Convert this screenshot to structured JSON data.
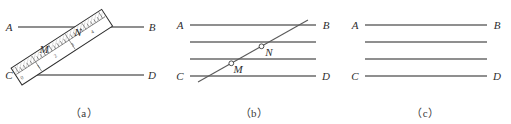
{
  "figure": {
    "panels": [
      {
        "id": "a",
        "caption": "（a）",
        "description": "ruler-on-parallel-lines",
        "line_labels": {
          "A": "A",
          "B": "B",
          "C": "C",
          "D": "D"
        },
        "point_labels": {
          "M": "M",
          "N": "N"
        },
        "ruler": {
          "tick_numbers": [
            "0",
            "1",
            "2",
            "3",
            "4"
          ],
          "angle_deg": -33
        },
        "lines": [
          {
            "name": "line-AB",
            "left_label": "A",
            "right_label": "B",
            "y": 27
          },
          {
            "name": "line-CD",
            "left_label": "C",
            "right_label": "D",
            "y": 75
          }
        ]
      },
      {
        "id": "b",
        "caption": "（b）",
        "description": "four-parallel-lines-with-transversal",
        "line_labels": {
          "A": "A",
          "B": "B",
          "C": "C",
          "D": "D"
        },
        "point_labels": {
          "M": "M",
          "N": "N"
        },
        "lines": [
          {
            "name": "line-AB",
            "left_label": "A",
            "right_label": "B",
            "y": 25
          },
          {
            "name": "line-2",
            "left_label": "",
            "right_label": "",
            "y": 42
          },
          {
            "name": "line-3",
            "left_label": "",
            "right_label": "",
            "y": 59
          },
          {
            "name": "line-CD",
            "left_label": "C",
            "right_label": "D",
            "y": 76
          }
        ],
        "transversal": {
          "name": "transversal-line",
          "x1": 30,
          "y1": 82,
          "x2": 140,
          "y2": 20
        }
      },
      {
        "id": "c",
        "caption": "（c）",
        "description": "four-parallel-lines",
        "line_labels": {
          "A": "A",
          "B": "B",
          "C": "C",
          "D": "D"
        },
        "lines": [
          {
            "name": "line-AB",
            "left_label": "A",
            "right_label": "B",
            "y": 25
          },
          {
            "name": "line-2",
            "left_label": "",
            "right_label": "",
            "y": 42
          },
          {
            "name": "line-3",
            "left_label": "",
            "right_label": "",
            "y": 59
          },
          {
            "name": "line-CD",
            "left_label": "C",
            "right_label": "D",
            "y": 76
          }
        ]
      }
    ],
    "colors": {
      "line": "#6a6a6a",
      "ruler_outline": "#2e2e2e",
      "hatch": "#8a8a8a",
      "text": "#2e2e2e"
    }
  }
}
